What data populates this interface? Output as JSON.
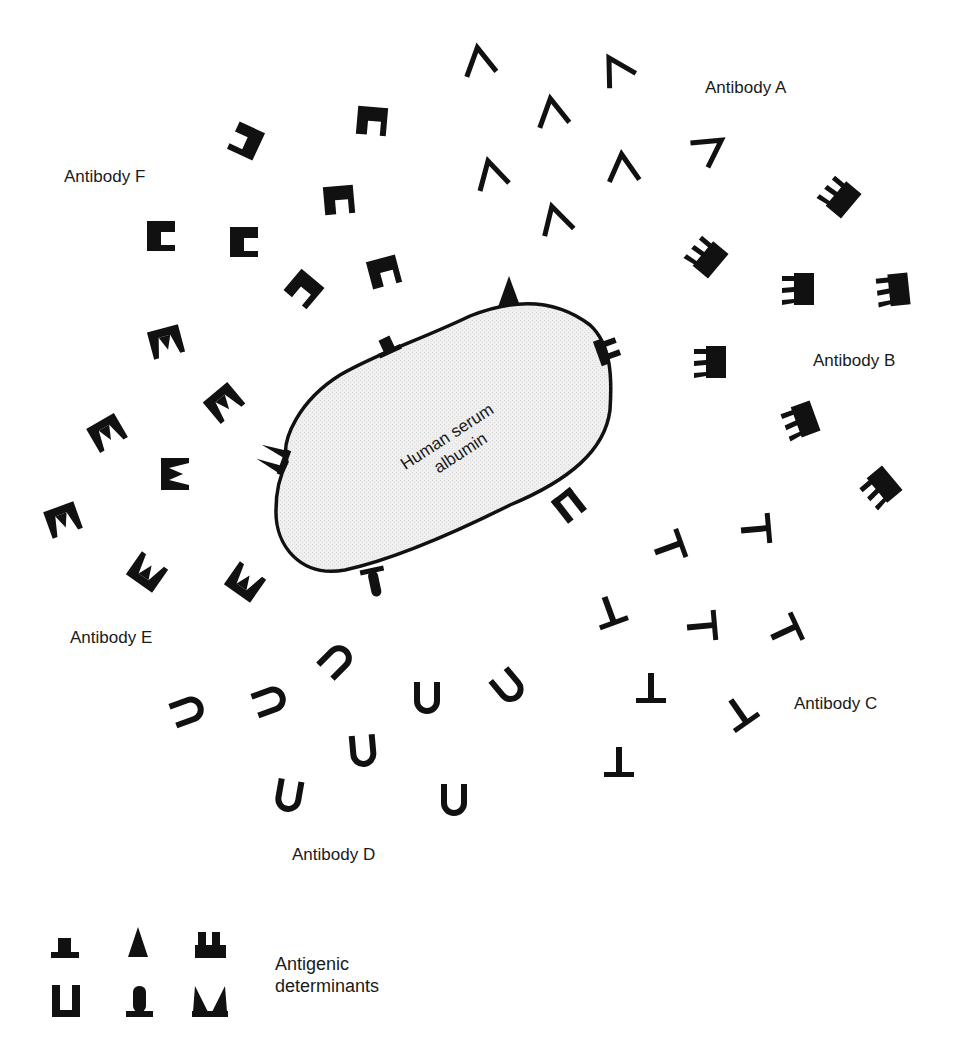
{
  "diagram": {
    "antigen": {
      "label_line1": "Human serum",
      "label_line2": "albumin",
      "fill_color": "#ececec",
      "outline_color": "#111111"
    },
    "antibodies": [
      {
        "id": "A",
        "label": "Antibody A",
        "shape": "chevron-lambda",
        "count": 8
      },
      {
        "id": "B",
        "label": "Antibody B",
        "shape": "double-slot-comb",
        "count": 7
      },
      {
        "id": "C",
        "label": "Antibody C",
        "shape": "inverted-t",
        "count": 8
      },
      {
        "id": "D",
        "label": "Antibody D",
        "shape": "u-bracket",
        "count": 8
      },
      {
        "id": "E",
        "label": "Antibody E",
        "shape": "notched-crown",
        "count": 8
      },
      {
        "id": "F",
        "label": "Antibody F",
        "shape": "single-slot-block",
        "count": 8
      }
    ],
    "legend": {
      "label_line1": "Antigenic",
      "label_line2": "determinants",
      "icons": [
        "top-hat-determinant",
        "triangle-determinant",
        "double-tab-determinant",
        "u-bracket-determinant",
        "rounded-post-determinant",
        "v-notch-determinant"
      ]
    },
    "ink_color": "#111111"
  }
}
